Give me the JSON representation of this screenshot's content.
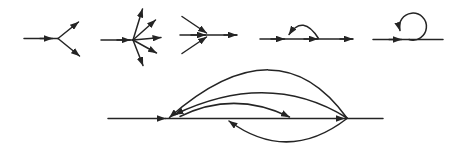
{
  "page": {
    "background_color": "#ffffff"
  },
  "figure": {
    "stroke_color": "#242424",
    "stroke_width": 1.5,
    "arrowhead": {
      "length": 9,
      "width": 6.6
    },
    "canvas": {
      "width": 460,
      "height": 154
    },
    "diagrams": [
      {
        "name": "diagram-branch-two-out",
        "paths": [
          {
            "name": "in-flow-line",
            "d": "M24,38.5 L58,38.5",
            "arrow": false
          },
          {
            "name": "in-arrow",
            "d": "M40,38.5 L52.5,38.5",
            "arrow": true
          },
          {
            "name": "out-arrow-up",
            "d": "M58,38.5 L78.5,22",
            "arrow": true
          },
          {
            "name": "out-arrow-down",
            "d": "M58,38.5 L79.5,56",
            "arrow": true
          }
        ]
      },
      {
        "name": "diagram-fan-five-out",
        "paths": [
          {
            "name": "in-flow-line",
            "d": "M101,40 L133,40",
            "arrow": false
          },
          {
            "name": "in-arrow",
            "d": "M117,40 L130,40",
            "arrow": true
          },
          {
            "name": "out-arrow-steep-up",
            "d": "M133,40 L142.5,9",
            "arrow": true
          },
          {
            "name": "out-arrow-up",
            "d": "M133,40 L155.5,20",
            "arrow": true
          },
          {
            "name": "out-arrow-right",
            "d": "M133,40 L161,37.5",
            "arrow": true
          },
          {
            "name": "out-arrow-down",
            "d": "M133,40 L156.5,53",
            "arrow": true
          },
          {
            "name": "out-arrow-steep-down",
            "d": "M133,40 L143,65.5",
            "arrow": true
          }
        ]
      },
      {
        "name": "diagram-converge-three-in",
        "paths": [
          {
            "name": "through-line",
            "d": "M180,35 L237,35",
            "arrow": false
          },
          {
            "name": "in-arrow",
            "d": "M191,35 L205.5,35",
            "arrow": true
          },
          {
            "name": "out-arrow",
            "d": "M224,35 L236.5,35",
            "arrow": true
          },
          {
            "name": "in-arrow-upper",
            "d": "M182,16.5 L206.5,33",
            "arrow": true
          },
          {
            "name": "in-arrow-lower",
            "d": "M182,53.5 L206.5,37",
            "arrow": true
          }
        ]
      },
      {
        "name": "diagram-line-with-back-arc",
        "paths": [
          {
            "name": "flow-line",
            "d": "M260,39 L353,39",
            "arrow": false
          },
          {
            "name": "flow-arrow-1",
            "d": "M271,39 L284.5,39",
            "arrow": true
          },
          {
            "name": "flow-arrow-2",
            "d": "M304,39 L317.5,39",
            "arrow": true
          },
          {
            "name": "flow-arrow-3",
            "d": "M340,39 L352.5,39",
            "arrow": true
          },
          {
            "name": "backward-arc",
            "d": "M318.5,38.5 Q303,14 289,34.5",
            "arrow": true
          }
        ]
      },
      {
        "name": "diagram-line-with-self-loop",
        "paths": [
          {
            "name": "flow-line",
            "d": "M373,39.5 L443,39.5",
            "arrow": false
          },
          {
            "name": "flow-arrow",
            "d": "M389,39.5 L401.5,39.5",
            "arrow": true
          },
          {
            "name": "self-loop",
            "d": "M409,39.5 A13.5,13.5 0 1 0 400,30.5",
            "arrow": true
          }
        ]
      },
      {
        "name": "diagram-long-line-with-arcs",
        "paths": [
          {
            "name": "flow-line-left",
            "d": "M108,118.5 L165.5,118.5",
            "arrow": true
          },
          {
            "name": "flow-line-middle",
            "d": "M165.5,118.5 L344.5,118.5",
            "arrow": true
          },
          {
            "name": "flow-line-right",
            "d": "M344.5,118.5 L383,118.5",
            "arrow": false
          },
          {
            "name": "return-arc-outer",
            "d": "M347,118 Q278,22 169.5,117.5",
            "arrow": true
          },
          {
            "name": "return-arc-inner",
            "d": "M347,118 Q269,69.5 175,114.5",
            "arrow": true
          },
          {
            "name": "forward-arc",
            "d": "M180,116.5 Q234,90 289.5,117",
            "arrow": true
          },
          {
            "name": "under-arc",
            "d": "M347,118.5 Q288,164 229,121",
            "arrow": true
          }
        ]
      }
    ]
  }
}
